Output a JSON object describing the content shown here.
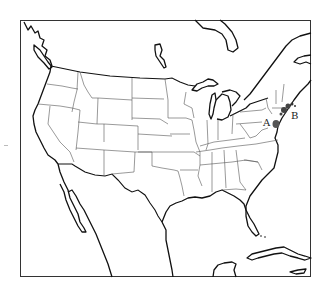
{
  "map": {
    "type": "outline map",
    "region": "Contiguous United States with parts of Canada, Mexico and Caribbean",
    "markers": [
      {
        "id": "A",
        "label": "A",
        "x": 276,
        "y": 125,
        "color": "#555555"
      },
      {
        "id": "B",
        "label": "B",
        "x": 288,
        "y": 108,
        "color": "#555555"
      }
    ],
    "colors": {
      "coastline": "#111111",
      "state_lines": "#555555",
      "frame": "#333333",
      "background": "#ffffff"
    }
  }
}
